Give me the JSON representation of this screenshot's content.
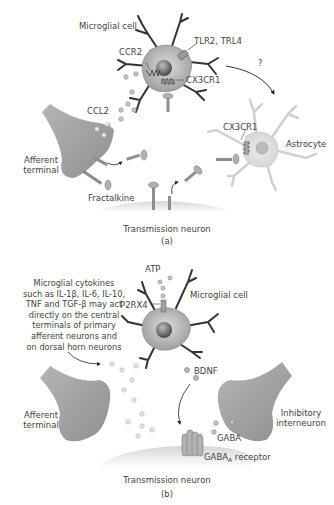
{
  "panel_a": {
    "caption": "(a)",
    "labels": {
      "microglial_cell": "Microglial cell",
      "tlr": "TLR2, TRL4",
      "ccr2": "CCR2",
      "cx3cr1_microglia": "CX3CR1",
      "question": "?",
      "ccl2": "CCL2",
      "cx3cr1_astrocyte": "CX3CR1",
      "afferent_terminal_line1": "Afferent",
      "afferent_terminal_line2": "terminal",
      "astrocyte": "Astrocyte",
      "fractalkine": "Fractalkine",
      "transmission_neuron": "Transmission neuron"
    }
  },
  "panel_b": {
    "caption": "(b)",
    "labels": {
      "atp": "ATP",
      "p2rx4": "P2RX4",
      "microglial_cell": "Microglial cell",
      "bdnf": "BDNF",
      "afferent_terminal_line1": "Afferent",
      "afferent_terminal_line2": "terminal",
      "inhibitory_line1": "Inhibitory",
      "inhibitory_line2": "interneuron",
      "gaba": "GABA",
      "gaba_receptor_main": "GABA",
      "gaba_receptor_sub": "A",
      "gaba_receptor_suffix": " receptor",
      "transmission_neuron": "Transmission neuron"
    },
    "cytokine_note": [
      "Microglial cytokines",
      "such as IL-1β, IL-6, IL-10,",
      "TNF and TGF-β may act",
      "directly on the central",
      "terminals of primary",
      "afferent neurons and",
      "on dorsal horn neurons"
    ]
  },
  "colors": {
    "cell_fill": "#a9a9a9",
    "cell_light": "#cfcfcf",
    "nucleus": "#6e6e6e",
    "dendrite": "#333333",
    "line": "#444444"
  }
}
